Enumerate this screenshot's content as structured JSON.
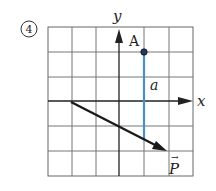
{
  "problem": {
    "number_label": "4",
    "grid": {
      "cols": 6,
      "rows": 6
    },
    "axes": {
      "x_label": "x",
      "y_label": "y"
    },
    "point": {
      "label": "A"
    },
    "segment": {
      "label": "a",
      "color": "#4a90c8"
    },
    "vector": {
      "label": "P",
      "arrow_glyph": "→",
      "color": "#1a1a1a"
    }
  }
}
